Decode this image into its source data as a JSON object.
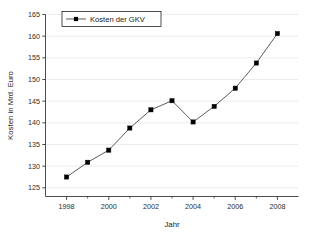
{
  "chart_data": {
    "type": "line",
    "title": "",
    "xlabel": "Jahr",
    "ylabel": "Kosten in Mrd. Euro",
    "xlim": [
      1997,
      2009
    ],
    "ylim": [
      123,
      165
    ],
    "xticks": [
      1998,
      2000,
      2002,
      2004,
      2006,
      2008
    ],
    "xtick_labels": [
      "1998",
      "2000",
      "2002",
      "2004",
      "2006",
      "2008"
    ],
    "xminor_ticks": [
      1999,
      2001,
      2003,
      2005,
      2007
    ],
    "yticks": [
      125,
      130,
      135,
      140,
      145,
      150,
      155,
      160,
      165
    ],
    "ytick_labels": [
      "125",
      "130",
      "135",
      "140",
      "145",
      "150",
      "155",
      "160",
      "165"
    ],
    "grid": "horizontal",
    "legend_position": "top-left",
    "x": [
      1998,
      1999,
      2000,
      2001,
      2002,
      2003,
      2004,
      2005,
      2006,
      2007,
      2008
    ],
    "series": [
      {
        "name": "Kosten der GKV",
        "marker": "square",
        "color": "#000000",
        "line_color": "#4a4a4a",
        "values": [
          127.5,
          130.9,
          133.7,
          138.8,
          143.0,
          145.1,
          140.2,
          143.8,
          148.0,
          153.8,
          160.6
        ]
      }
    ]
  },
  "legend": {
    "entries": [
      {
        "label": "Kosten der GKV"
      }
    ]
  },
  "axes": {
    "x_title": "Jahr",
    "y_title": "Kosten in Mrd. Euro"
  }
}
